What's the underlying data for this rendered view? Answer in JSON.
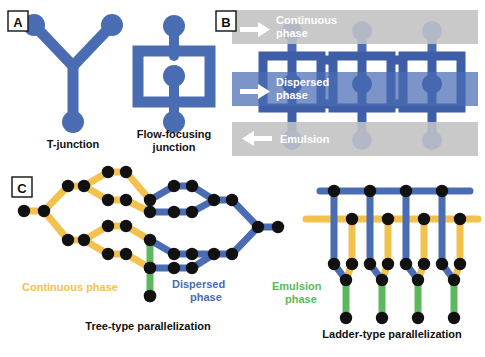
{
  "figure": {
    "panels": [
      {
        "id": "A",
        "letter": "A"
      },
      {
        "id": "B",
        "letter": "B"
      },
      {
        "id": "C",
        "letter": "C"
      }
    ]
  },
  "colors": {
    "dispersed_blue": "#4a6cb3",
    "dispersed_blue_dark": "#3f5ea8",
    "continuous_yellow": "#f2c14e",
    "emulsion_green": "#5cb85c",
    "node_black": "#111111",
    "band_gray": "#c9c9c9",
    "band_blue_overlay": "#4a6cb3",
    "text_black": "#111111",
    "text_white": "#ffffff"
  },
  "panelA": {
    "letter": "A",
    "caption_left": "T-junction",
    "caption_right_line1": "Flow-focusing",
    "caption_right_line2": "junction"
  },
  "panelB": {
    "letter": "B",
    "bands": [
      {
        "name": "continuous",
        "label_line1": "Continuous",
        "label_line2": "phase",
        "arrow": "right"
      },
      {
        "name": "dispersed",
        "label_line1": "Dispersed",
        "label_line2": "phase",
        "arrow": "right"
      },
      {
        "name": "emulsion",
        "label_line1": "Emulsion",
        "label_line2": "",
        "arrow": "left"
      }
    ],
    "junction_count": 3
  },
  "panelC": {
    "letter": "C",
    "tree": {
      "caption": "Tree-type parallelization",
      "legend": [
        {
          "name": "continuous",
          "label": "Continuous phase"
        },
        {
          "name": "dispersed",
          "label_line1": "Dispersed",
          "label_line2": "phase"
        }
      ],
      "branches": 4
    },
    "ladder": {
      "caption": "Ladder-type parallelization",
      "legend": [
        {
          "name": "emulsion",
          "label_line1": "Emulsion",
          "label_line2": "phase"
        }
      ],
      "units": 4
    }
  }
}
